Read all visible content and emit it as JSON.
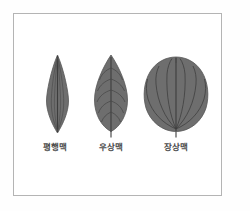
{
  "figure": {
    "background_color": "#ffffff",
    "frame_color": "#b4b4b4",
    "leaf_fill_color": "#6e6e6e",
    "leaf_outline_color": "#5a5a5a",
    "vein_color": "#444444",
    "label_color": "#4a4a4a"
  },
  "leaves": [
    {
      "id": "parallel",
      "label": "평행맥",
      "venation_type": "parallel",
      "shape": "narrow-lanceolate"
    },
    {
      "id": "pinnate",
      "label": "우상맥",
      "venation_type": "pinnate",
      "shape": "ovate"
    },
    {
      "id": "palmate",
      "label": "장상맥",
      "venation_type": "palmate",
      "shape": "broad-orbicular"
    }
  ]
}
